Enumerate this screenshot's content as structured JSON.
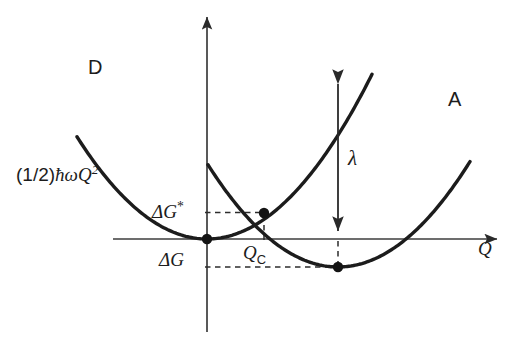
{
  "figure": {
    "background_color": "#ffffff",
    "ink_color": "#1c1c1c",
    "axis_color": "#3a3a3a",
    "curve_color": "#1c1c1c"
  },
  "axes": {
    "x_axis_label": "Q",
    "y_axis_label": "",
    "origin_px": [
      207,
      239
    ],
    "x_axis_y_px": 239,
    "y_axis_x_px": 207,
    "x_axis_range_px": [
      113,
      500
    ],
    "y_axis_range_px": [
      14,
      332
    ],
    "x_arrow": "right",
    "y_arrow": "up",
    "grid": false
  },
  "labels": {
    "donor_curve": "D",
    "acceptor_curve": "A",
    "potential_formula_prefix": "(1/2)",
    "potential_formula_hbar": "ħ",
    "potential_formula_omega": "ω",
    "potential_formula_q": "Q",
    "potential_formula_exponent": "2",
    "activation_energy": "ΔG",
    "activation_energy_star": "*",
    "free_energy": "ΔG",
    "crossing_coordinate": "Q",
    "crossing_coordinate_sub": "C",
    "reorganization_energy": "λ",
    "x_axis": "Q"
  },
  "chart_data": {
    "type": "line",
    "title": "",
    "subtitle": "",
    "xlabel": "Q",
    "ylabel": "",
    "legend_position": "inline-curve-ends",
    "grid": false,
    "axis_origin_note": "Donor parabola vertex sits at the origin (0,0)",
    "series": [
      {
        "name": "D",
        "label": "D",
        "description": "Donor diabatic free-energy parabola, (1/2)ħωQ², vertex at origin",
        "vertex": [
          0,
          0
        ],
        "curvature_k": 0.00605,
        "vertex_px": [
          207,
          239
        ],
        "endpoints_px": [
          [
            77,
            68
          ],
          [
            372,
            292
          ]
        ],
        "x_px_range": [
          77,
          372
        ]
      },
      {
        "name": "A",
        "label": "A",
        "description": "Acceptor diabatic free-energy parabola, shifted right and down by ΔG",
        "vertex_px": [
          338,
          267
        ],
        "curvature_k": 0.00605,
        "endpoints_px": [
          [
            208,
            102
          ],
          [
            470,
            95
          ]
        ],
        "x_px_range": [
          208,
          470
        ]
      }
    ],
    "annotations": [
      {
        "name": "crossing-point",
        "label": "ΔG*",
        "type": "point",
        "px": [
          264,
          213
        ],
        "note": "Intersection of D and A parabolas; activation barrier height ΔG*"
      },
      {
        "name": "donor-minimum",
        "label": "",
        "type": "point",
        "px": [
          207,
          239
        ],
        "note": "Donor minimum at origin"
      },
      {
        "name": "acceptor-minimum",
        "label": "ΔG",
        "type": "point",
        "px": [
          338,
          267
        ],
        "note": "Acceptor minimum, lies below axis at driving force ΔG"
      },
      {
        "name": "reorganization-arrow",
        "label": "λ",
        "type": "double-arrow",
        "from_px": [
          338,
          73
        ],
        "to_px": [
          338,
          239
        ],
        "note": "Reorganization energy λ measured on the donor curve at the acceptor minimum coordinate"
      },
      {
        "name": "qc-marker",
        "label": "Q_C",
        "type": "vertical-dashed",
        "from_px": [
          264,
          213
        ],
        "to_px": [
          264,
          239
        ],
        "note": "Crossing nuclear coordinate Q_C"
      },
      {
        "name": "dgstar-level",
        "label": "ΔG*",
        "type": "horizontal-dashed",
        "from_px": [
          207,
          213
        ],
        "to_px": [
          264,
          213
        ]
      },
      {
        "name": "dg-level",
        "label": "ΔG",
        "type": "horizontal-dashed",
        "from_px": [
          207,
          267
        ],
        "to_px": [
          338,
          267
        ]
      }
    ]
  }
}
